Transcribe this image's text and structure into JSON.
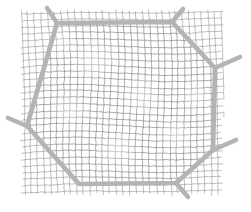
{
  "figure": {
    "title": "",
    "caption": "",
    "background_color": "#ffffff",
    "width": 251,
    "height": 212
  },
  "chart_data": {
    "type": "scatter",
    "title": "",
    "subtitle": "",
    "xlabel": "",
    "ylabel": "",
    "grid": true,
    "legend": null,
    "lattice": {
      "name": "background-lattice",
      "line_color": "#6e6e6e",
      "line_width": 0.7,
      "cell_spacing": 6.6,
      "rotation_deg_outer": -1.2,
      "rotation_deg_inner": 2.4,
      "jitter": 0.55,
      "extent": {
        "x_min": 25,
        "y_min": 14,
        "x_max": 219,
        "y_max": 191
      }
    },
    "boundary": {
      "name": "grain-boundary-polygon",
      "line_color": "#b4b4b4",
      "line_width": 4.6,
      "closed": true,
      "vertices": [
        {
          "id": "v-top-left",
          "x": 57,
          "y": 23
        },
        {
          "id": "v-top-right",
          "x": 172,
          "y": 22
        },
        {
          "id": "v-right-upper",
          "x": 215,
          "y": 68
        },
        {
          "id": "v-right-lower",
          "x": 213,
          "y": 150
        },
        {
          "id": "v-bottom-right",
          "x": 176,
          "y": 183
        },
        {
          "id": "v-bottom-left",
          "x": 79,
          "y": 184
        },
        {
          "id": "v-left",
          "x": 27,
          "y": 126
        }
      ]
    },
    "branches": [
      {
        "id": "branch-top-left",
        "from": "v-top-left",
        "x1": 57,
        "y1": 23,
        "x2": 47,
        "y2": 8
      },
      {
        "id": "branch-top-right",
        "from": "v-top-right",
        "x1": 172,
        "y1": 22,
        "x2": 183,
        "y2": 9
      },
      {
        "id": "branch-right-upper",
        "from": "v-right-upper",
        "x1": 215,
        "y1": 68,
        "x2": 240,
        "y2": 57
      },
      {
        "id": "branch-right-lower",
        "from": "v-right-lower",
        "x1": 213,
        "y1": 150,
        "x2": 236,
        "y2": 140
      },
      {
        "id": "branch-bottom-right",
        "from": "v-bottom-right",
        "x1": 176,
        "y1": 183,
        "x2": 188,
        "y2": 197
      },
      {
        "id": "branch-left",
        "from": "v-left",
        "x1": 27,
        "y1": 126,
        "x2": 8,
        "y2": 118
      }
    ],
    "colors": {
      "lattice": "#6e6e6e",
      "boundary": "#b4b4b4",
      "background": "#ffffff"
    }
  }
}
